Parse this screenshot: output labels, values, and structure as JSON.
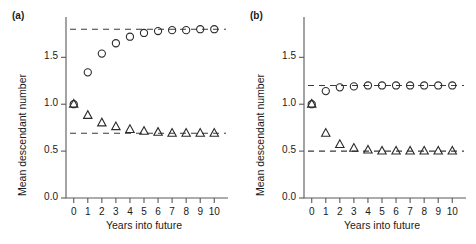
{
  "figure": {
    "panels": [
      {
        "id": "a",
        "label": "(a)",
        "xlabel": "Years into future",
        "ylabel": "Mean descendant number",
        "xticks": [
          "0",
          "1",
          "2",
          "3",
          "4",
          "5",
          "6",
          "7",
          "8",
          "9",
          "10"
        ],
        "yticks": [
          "0.0",
          "0.5",
          "1.0",
          "1.5"
        ]
      },
      {
        "id": "b",
        "label": "(b)",
        "xlabel": "Years into future",
        "ylabel": "Mean descendant number",
        "xticks": [
          "0",
          "1",
          "2",
          "3",
          "4",
          "5",
          "6",
          "7",
          "8",
          "9",
          "10"
        ],
        "yticks": [
          "0.0",
          "0.5",
          "1.0",
          "1.5"
        ]
      }
    ]
  },
  "chart_data": [
    {
      "type": "scatter",
      "panel": "a",
      "title": "(a)",
      "xlabel": "Years into future",
      "ylabel": "Mean descendant number",
      "x": [
        0,
        1,
        2,
        3,
        4,
        5,
        6,
        7,
        8,
        9,
        10
      ],
      "xlim": [
        -0.55,
        10.55
      ],
      "ylim": [
        0.0,
        1.93
      ],
      "xticks": [
        0,
        1,
        2,
        3,
        4,
        5,
        6,
        7,
        8,
        9,
        10
      ],
      "yticks": [
        0.0,
        0.5,
        1.0,
        1.5
      ],
      "grid": false,
      "legend": false,
      "series": [
        {
          "name": "circle-series",
          "marker": "open-circle",
          "values": [
            1.0,
            1.34,
            1.54,
            1.65,
            1.72,
            1.76,
            1.78,
            1.79,
            1.79,
            1.8,
            1.8
          ]
        },
        {
          "name": "triangle-series",
          "marker": "open-triangle",
          "values": [
            1.0,
            0.88,
            0.8,
            0.76,
            0.73,
            0.71,
            0.7,
            0.69,
            0.69,
            0.69,
            0.69
          ]
        }
      ],
      "reference_lines": [
        {
          "name": "circle-asymptote",
          "y": 1.8,
          "style": "dashed"
        },
        {
          "name": "triangle-asymptote",
          "y": 0.69,
          "style": "dashed"
        }
      ]
    },
    {
      "type": "scatter",
      "panel": "b",
      "title": "(b)",
      "xlabel": "Years into future",
      "ylabel": "Mean descendant number",
      "x": [
        0,
        1,
        2,
        3,
        4,
        5,
        6,
        7,
        8,
        9,
        10
      ],
      "xlim": [
        -0.55,
        10.55
      ],
      "ylim": [
        0.0,
        1.93
      ],
      "xticks": [
        0,
        1,
        2,
        3,
        4,
        5,
        6,
        7,
        8,
        9,
        10
      ],
      "yticks": [
        0.0,
        0.5,
        1.0,
        1.5
      ],
      "grid": false,
      "legend": false,
      "series": [
        {
          "name": "circle-series",
          "marker": "open-circle",
          "values": [
            1.0,
            1.14,
            1.18,
            1.19,
            1.2,
            1.2,
            1.2,
            1.2,
            1.2,
            1.2,
            1.2
          ]
        },
        {
          "name": "triangle-series",
          "marker": "open-triangle",
          "values": [
            1.0,
            0.69,
            0.57,
            0.53,
            0.51,
            0.5,
            0.5,
            0.5,
            0.5,
            0.5,
            0.5
          ]
        }
      ],
      "reference_lines": [
        {
          "name": "circle-asymptote",
          "y": 1.2,
          "style": "dashed"
        },
        {
          "name": "triangle-asymptote",
          "y": 0.5,
          "style": "dashed"
        }
      ]
    }
  ]
}
